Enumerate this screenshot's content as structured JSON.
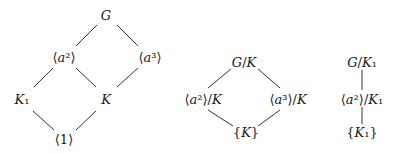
{
  "diagrams": [
    {
      "name": "subgroup-lattice-G",
      "nodes": [
        {
          "id": "G",
          "label": "G",
          "x": 106,
          "y": 15
        },
        {
          "id": "a2",
          "label": "⟨a²⟩",
          "x": 64,
          "y": 57
        },
        {
          "id": "a3",
          "label": "⟨a³⟩",
          "x": 150,
          "y": 57
        },
        {
          "id": "K1",
          "label": "K₁",
          "x": 22,
          "y": 99
        },
        {
          "id": "K",
          "label": "K",
          "x": 106,
          "y": 99
        },
        {
          "id": "one",
          "label": "⟨1⟩",
          "x": 64,
          "y": 139
        }
      ],
      "edges": [
        [
          "G",
          "a2"
        ],
        [
          "G",
          "a3"
        ],
        [
          "a2",
          "K1"
        ],
        [
          "a2",
          "K"
        ],
        [
          "a3",
          "K"
        ],
        [
          "K1",
          "one"
        ],
        [
          "K",
          "one"
        ]
      ]
    },
    {
      "name": "quotient-lattice-G-mod-K",
      "nodes": [
        {
          "id": "GK",
          "label": "G/K",
          "x": 244,
          "y": 62
        },
        {
          "id": "a2K",
          "label": "⟨a²⟩/K",
          "x": 203,
          "y": 99
        },
        {
          "id": "a3K",
          "label": "⟨a³⟩/K",
          "x": 288,
          "y": 99
        },
        {
          "id": "KK",
          "label": "{K}",
          "x": 246,
          "y": 132
        }
      ],
      "edges": [
        [
          "GK",
          "a2K"
        ],
        [
          "GK",
          "a3K"
        ],
        [
          "a2K",
          "KK"
        ],
        [
          "a3K",
          "KK"
        ]
      ]
    },
    {
      "name": "quotient-lattice-G-mod-K1",
      "nodes": [
        {
          "id": "GK1",
          "label": "G/K₁",
          "x": 362,
          "y": 62
        },
        {
          "id": "a2K1",
          "label": "⟨a²⟩/K₁",
          "x": 362,
          "y": 99
        },
        {
          "id": "K1K1",
          "label": "{K₁}",
          "x": 362,
          "y": 132
        }
      ],
      "edges": [
        [
          "GK1",
          "a2K1"
        ],
        [
          "a2K1",
          "K1K1"
        ]
      ]
    }
  ]
}
